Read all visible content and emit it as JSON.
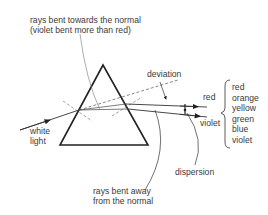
{
  "diagram": {
    "labels": {
      "towards_normal_line1": "rays bent towards the normal",
      "towards_normal_line2": "(violet bent more than red)",
      "deviation": "deviation",
      "white_light_line1": "white",
      "white_light_line2": "light",
      "red": "red",
      "violet": "violet",
      "dispersion": "dispersion",
      "away_normal_line1": "rays bent away",
      "away_normal_line2": "from the normal"
    },
    "spectrum": [
      "red",
      "orange",
      "yellow",
      "green",
      "blue",
      "violet"
    ],
    "colors": {
      "ink": "#2a2a2a",
      "thin": "#555555"
    }
  }
}
